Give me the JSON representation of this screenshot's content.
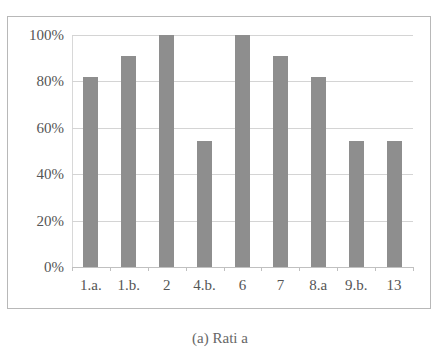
{
  "chart_data": {
    "type": "bar",
    "title": "",
    "xlabel": "",
    "ylabel": "",
    "categories": [
      "1.a.",
      "1.b.",
      "2",
      "4.b.",
      "6",
      "7",
      "8.a",
      "9.b.",
      "13"
    ],
    "values": [
      81.8,
      90.9,
      100,
      54.5,
      100,
      90.9,
      81.8,
      54.5,
      54.5
    ],
    "value_unit": "%",
    "ylim": [
      0,
      100
    ],
    "yticks": [
      "0%",
      "20%",
      "40%",
      "60%",
      "80%",
      "100%"
    ],
    "grid": true,
    "legend": null,
    "bar_color": "#8e8e8e",
    "caption": "(a) Rati... ...a (caption cropped)"
  },
  "caption_text": "(a) Rati          a"
}
